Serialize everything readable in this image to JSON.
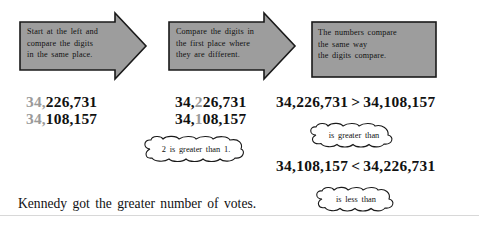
{
  "page": {
    "background": "#ffffff",
    "shape_fill": "#9d9d9d",
    "shape_stroke": "#1a1a1a",
    "dim_digit_color": "#9a9a9a",
    "text_color": "#111111"
  },
  "steps": [
    {
      "id": "step-1",
      "shape": "right-arrow",
      "text": "Start at the left and\ncompare the digits\nin the same place."
    },
    {
      "id": "step-2",
      "shape": "right-arrow",
      "text": "Compare the digits in\nthe first place where\nthey are different."
    },
    {
      "id": "step-3",
      "shape": "rectangle",
      "text": "The numbers compare\nthe same way\nthe digits compare."
    }
  ],
  "columns": {
    "left": {
      "rows": [
        {
          "dim": "34,",
          "rest": "226,731"
        },
        {
          "dim": "34,",
          "rest": "108,157"
        }
      ]
    },
    "middle": {
      "rows": [
        {
          "pre": "34,",
          "dim": "2",
          "post": "26,731"
        },
        {
          "pre": "34,",
          "dim": "1",
          "post": "08,157"
        }
      ]
    },
    "right": {
      "comparisons": [
        {
          "left": "34,226,731",
          "op": ">",
          "right": "34,108,157"
        },
        {
          "left": "34,108,157",
          "op": "<",
          "right": "34,226,731"
        }
      ]
    }
  },
  "bubbles": [
    {
      "id": "bubble-digit-compare",
      "text": "2 is greater than 1."
    },
    {
      "id": "bubble-is-greater-than",
      "text": "is greater than"
    },
    {
      "id": "bubble-is-less-than",
      "text": "is less than"
    }
  ],
  "footer": {
    "sentence": "Kennedy got the greater number of votes."
  }
}
